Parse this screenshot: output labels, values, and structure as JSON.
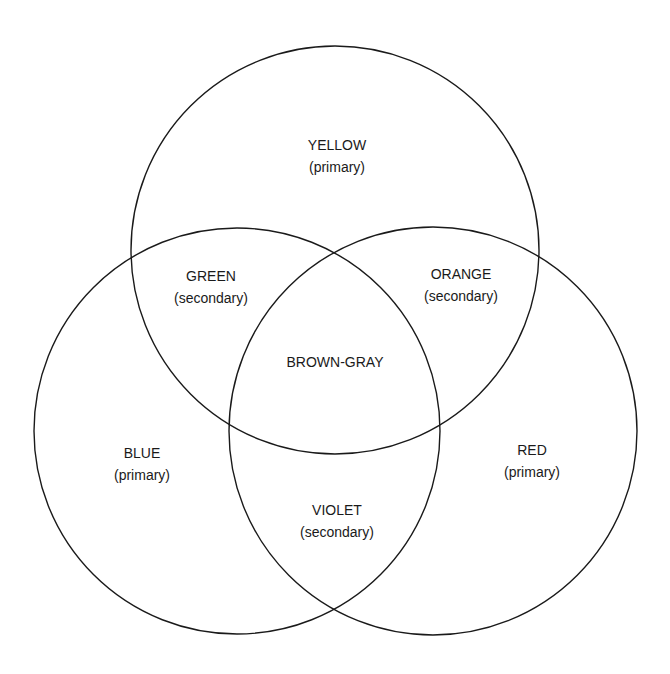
{
  "diagram": {
    "type": "venn",
    "stroke_color": "#1a1a1a",
    "circles": [
      {
        "id": "yellow",
        "cx": 335,
        "cy": 250,
        "r": 204
      },
      {
        "id": "blue",
        "cx": 237,
        "cy": 431,
        "r": 203
      },
      {
        "id": "red",
        "cx": 433,
        "cy": 431,
        "r": 204
      }
    ],
    "regions": {
      "yellow": {
        "name": "YELLOW",
        "type": "(primary)"
      },
      "green": {
        "name": "GREEN",
        "type": "(secondary)"
      },
      "orange": {
        "name": "ORANGE",
        "type": "(secondary)"
      },
      "brown_gray": {
        "name": "BROWN-GRAY"
      },
      "blue": {
        "name": "BLUE",
        "type": "(primary)"
      },
      "red": {
        "name": "RED",
        "type": "(primary)"
      },
      "violet": {
        "name": "VIOLET",
        "type": "(secondary)"
      }
    }
  }
}
